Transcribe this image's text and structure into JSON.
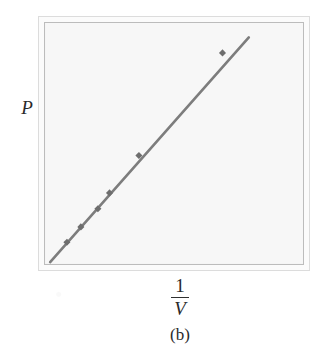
{
  "figure": {
    "panel_caption": "(b)",
    "y_axis_label": "P",
    "x_axis_label_numerator": "1",
    "x_axis_label_denominator": "V",
    "line_color": "#7d7d7d",
    "marker_color": "#6e6e6e",
    "frame_outer_color": "#dcdcdc",
    "frame_inner_color": "#bcbcbc",
    "plot_background": "#f7f7f7",
    "page_background": "#ffffff"
  },
  "chart_data": {
    "type": "line",
    "title": "",
    "subtitle": "",
    "xlabel": "1/V",
    "ylabel": "P",
    "xlim": [
      0,
      1
    ],
    "ylim": [
      0,
      1
    ],
    "grid": false,
    "legend": false,
    "axis_ticks": false,
    "series": [
      {
        "name": "P vs 1/V",
        "marker": "square",
        "line_style": "solid",
        "x": [
          0.085,
          0.139,
          0.205,
          0.25,
          0.364,
          0.688
        ],
        "y": [
          0.09,
          0.154,
          0.229,
          0.295,
          0.45,
          0.876
        ]
      }
    ],
    "fit_line": {
      "x": [
        0.02,
        0.79
      ],
      "y": [
        0.008,
        0.94
      ],
      "slope": 1.21,
      "intercept": 0.0
    }
  }
}
